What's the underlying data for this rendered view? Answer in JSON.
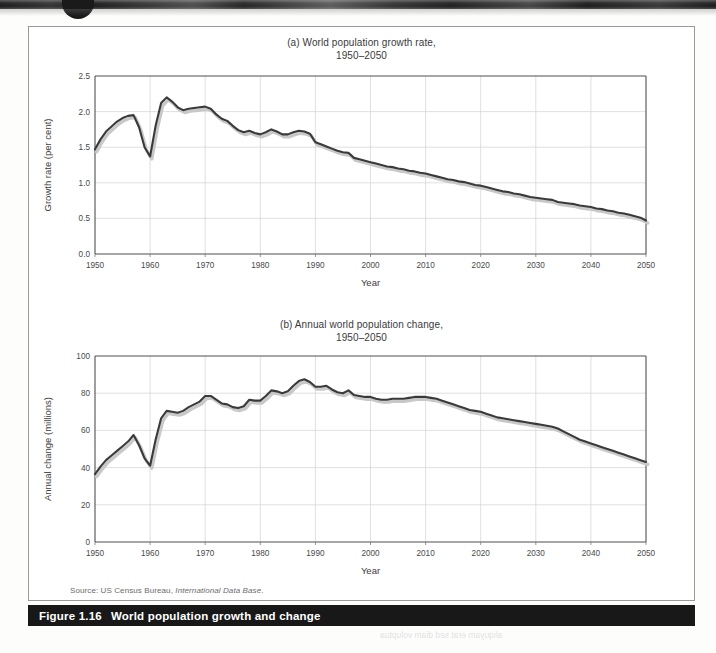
{
  "figure": {
    "caption_number": "Figure 1.16",
    "caption_text": "World population growth and change",
    "source_prefix": "Source: US Census Bureau,",
    "source_italic": "International Data Base",
    "source_suffix": "."
  },
  "panel_a": {
    "title_line1": "(a) World population growth rate,",
    "title_line2": "1950–2050",
    "xlabel": "Year",
    "ylabel": "Growth rate (per cent)"
  },
  "panel_b": {
    "title_line1": "(b) Annual world population change,",
    "title_line2": "1950–2050",
    "xlabel": "Year",
    "ylabel": "Annual change (millions)"
  },
  "colors": {
    "series_line": "#3a3a3a",
    "series_shadow": "#c8c8c8",
    "grid": "#d3d3d3",
    "frame": "#4f4f4f",
    "caption_bar": "#181818",
    "caption_text": "#ffffff",
    "page": "#ffffff"
  },
  "chart_data": [
    {
      "id": "panel-a",
      "type": "line",
      "title": "(a) World population growth rate, 1950–2050",
      "xlabel": "Year",
      "ylabel": "Growth rate (per cent)",
      "xlim": [
        1950,
        2050
      ],
      "ylim": [
        0.0,
        2.5
      ],
      "xticks": [
        1950,
        1960,
        1970,
        1980,
        1990,
        2000,
        2010,
        2020,
        2030,
        2040,
        2050
      ],
      "yticks": [
        0.0,
        0.5,
        1.0,
        1.5,
        2.0,
        2.5
      ],
      "ytick_labels": [
        "0.0",
        "0.5",
        "1.0",
        "1.5",
        "2.0",
        "2.5"
      ],
      "grid": true,
      "legend": "none",
      "series": [
        {
          "name": "World population growth rate (per cent)",
          "x": [
            1950,
            1951,
            1952,
            1953,
            1954,
            1955,
            1956,
            1957,
            1958,
            1959,
            1960,
            1961,
            1962,
            1963,
            1964,
            1965,
            1966,
            1967,
            1968,
            1969,
            1970,
            1971,
            1972,
            1973,
            1974,
            1975,
            1976,
            1977,
            1978,
            1979,
            1980,
            1981,
            1982,
            1983,
            1984,
            1985,
            1986,
            1987,
            1988,
            1989,
            1990,
            1991,
            1992,
            1993,
            1994,
            1995,
            1996,
            1997,
            1998,
            1999,
            2000,
            2001,
            2002,
            2003,
            2004,
            2005,
            2006,
            2007,
            2008,
            2009,
            2010,
            2011,
            2012,
            2013,
            2014,
            2015,
            2016,
            2017,
            2018,
            2019,
            2020,
            2021,
            2022,
            2023,
            2024,
            2025,
            2026,
            2027,
            2028,
            2029,
            2030,
            2031,
            2032,
            2033,
            2034,
            2035,
            2036,
            2037,
            2038,
            2039,
            2040,
            2041,
            2042,
            2043,
            2044,
            2045,
            2046,
            2047,
            2048,
            2049,
            2050
          ],
          "y": [
            1.47,
            1.61,
            1.72,
            1.79,
            1.86,
            1.91,
            1.94,
            1.95,
            1.78,
            1.5,
            1.37,
            1.8,
            2.12,
            2.2,
            2.14,
            2.06,
            2.02,
            2.04,
            2.05,
            2.06,
            2.07,
            2.04,
            1.96,
            1.9,
            1.87,
            1.8,
            1.74,
            1.71,
            1.73,
            1.7,
            1.68,
            1.71,
            1.75,
            1.72,
            1.68,
            1.68,
            1.71,
            1.73,
            1.72,
            1.69,
            1.57,
            1.54,
            1.51,
            1.48,
            1.45,
            1.43,
            1.42,
            1.35,
            1.33,
            1.31,
            1.29,
            1.27,
            1.25,
            1.23,
            1.22,
            1.2,
            1.19,
            1.17,
            1.16,
            1.14,
            1.13,
            1.11,
            1.09,
            1.07,
            1.05,
            1.04,
            1.02,
            1.01,
            0.99,
            0.97,
            0.96,
            0.94,
            0.92,
            0.9,
            0.88,
            0.87,
            0.85,
            0.84,
            0.82,
            0.8,
            0.79,
            0.78,
            0.77,
            0.76,
            0.73,
            0.72,
            0.71,
            0.7,
            0.68,
            0.67,
            0.66,
            0.64,
            0.63,
            0.61,
            0.6,
            0.58,
            0.57,
            0.55,
            0.53,
            0.51,
            0.47
          ]
        }
      ]
    },
    {
      "id": "panel-b",
      "type": "line",
      "title": "(b) Annual world population change, 1950–2050",
      "xlabel": "Year",
      "ylabel": "Annual change (millions)",
      "xlim": [
        1950,
        2050
      ],
      "ylim": [
        0,
        100
      ],
      "xticks": [
        1950,
        1960,
        1970,
        1980,
        1990,
        2000,
        2010,
        2020,
        2030,
        2040,
        2050
      ],
      "yticks": [
        0,
        20,
        40,
        60,
        80,
        100
      ],
      "ytick_labels": [
        "0",
        "20",
        "40",
        "60",
        "80",
        "100"
      ],
      "grid": true,
      "legend": "none",
      "series": [
        {
          "name": "Annual world population change (millions)",
          "x": [
            1950,
            1951,
            1952,
            1953,
            1954,
            1955,
            1956,
            1957,
            1958,
            1959,
            1960,
            1961,
            1962,
            1963,
            1964,
            1965,
            1966,
            1967,
            1968,
            1969,
            1970,
            1971,
            1972,
            1973,
            1974,
            1975,
            1976,
            1977,
            1978,
            1979,
            1980,
            1981,
            1982,
            1983,
            1984,
            1985,
            1986,
            1987,
            1988,
            1989,
            1990,
            1991,
            1992,
            1993,
            1994,
            1995,
            1996,
            1997,
            1998,
            1999,
            2000,
            2001,
            2002,
            2003,
            2004,
            2005,
            2006,
            2007,
            2008,
            2009,
            2010,
            2011,
            2012,
            2013,
            2014,
            2015,
            2016,
            2017,
            2018,
            2019,
            2020,
            2021,
            2022,
            2023,
            2024,
            2025,
            2026,
            2027,
            2028,
            2029,
            2030,
            2031,
            2032,
            2033,
            2034,
            2035,
            2036,
            2037,
            2038,
            2039,
            2040,
            2041,
            2042,
            2043,
            2044,
            2045,
            2046,
            2047,
            2048,
            2049,
            2050
          ],
          "y": [
            36.5,
            40.5,
            44.0,
            46.5,
            49.0,
            51.5,
            54.0,
            57.5,
            52.0,
            45.0,
            41.0,
            55.0,
            66.5,
            70.5,
            70.0,
            69.5,
            70.5,
            72.5,
            74.0,
            75.5,
            78.5,
            78.5,
            76.5,
            74.5,
            74.0,
            72.5,
            72.0,
            73.0,
            76.5,
            76.0,
            76.0,
            78.5,
            81.5,
            81.0,
            80.0,
            81.0,
            84.0,
            86.5,
            87.5,
            86.0,
            83.5,
            83.5,
            84.0,
            82.0,
            80.5,
            80.0,
            81.5,
            79.0,
            78.5,
            78.0,
            78.0,
            77.0,
            76.5,
            76.5,
            77.0,
            77.0,
            77.0,
            77.5,
            78.0,
            78.0,
            78.0,
            77.5,
            77.0,
            76.0,
            75.0,
            74.0,
            73.0,
            72.0,
            71.0,
            70.5,
            70.0,
            69.0,
            68.0,
            67.0,
            66.5,
            66.0,
            65.5,
            65.0,
            64.5,
            64.0,
            63.5,
            63.0,
            62.5,
            62.0,
            61.0,
            59.5,
            58.0,
            56.5,
            55.0,
            54.0,
            53.0,
            52.0,
            51.0,
            50.0,
            49.0,
            48.0,
            47.0,
            46.0,
            45.0,
            44.0,
            43.0
          ]
        }
      ]
    }
  ]
}
